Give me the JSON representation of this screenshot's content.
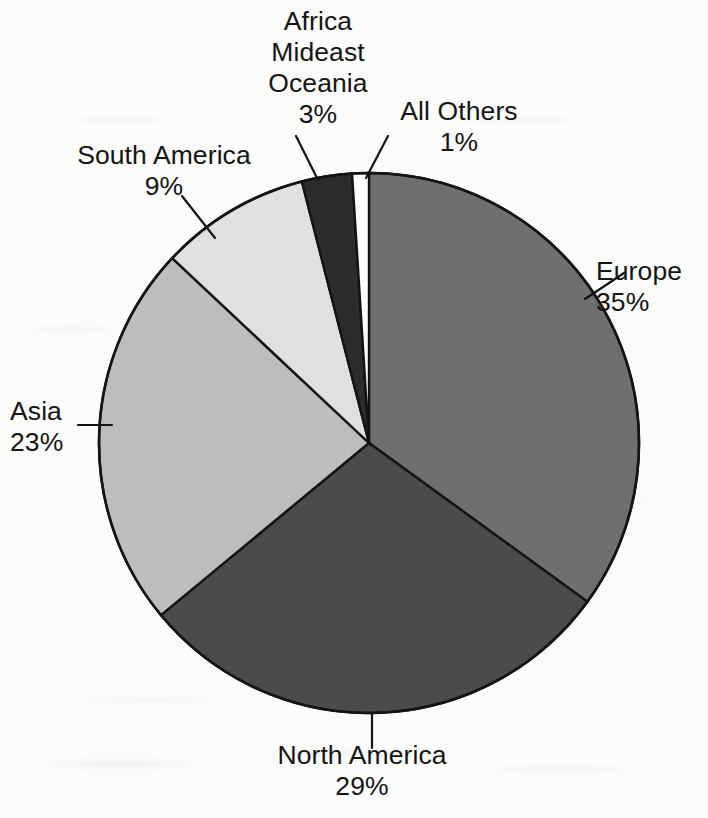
{
  "chart_data": {
    "type": "pie",
    "title": "",
    "subtitle": "",
    "xlabel": "",
    "ylabel": "",
    "legend_position": "none",
    "grid": false,
    "value_unit": "%",
    "start_angle_deg": 0,
    "direction": "clockwise",
    "categories": [
      "Europe",
      "North America",
      "Asia",
      "South America",
      "Africa Mideast Oceania",
      "All Others"
    ],
    "values": [
      35,
      29,
      23,
      9,
      3,
      1
    ],
    "total": 100,
    "slices": [
      {
        "name": "Europe",
        "label_lines": [
          "Europe"
        ],
        "value": 35,
        "value_label": "35%",
        "color": "#6f6f6f",
        "start_deg": 0,
        "end_deg": 126,
        "leader": true
      },
      {
        "name": "North America",
        "label_lines": [
          "North America"
        ],
        "value": 29,
        "value_label": "29%",
        "color": "#4b4b4b",
        "start_deg": 126,
        "end_deg": 230.4,
        "leader": true
      },
      {
        "name": "Asia",
        "label_lines": [
          "Asia"
        ],
        "value": 23,
        "value_label": "23%",
        "color": "#bdbdbd",
        "start_deg": 230.4,
        "end_deg": 313.2,
        "leader": true
      },
      {
        "name": "South America",
        "label_lines": [
          "South America"
        ],
        "value": 9,
        "value_label": "9%",
        "color": "#e0e0e0",
        "start_deg": 313.2,
        "end_deg": 345.6,
        "leader": true
      },
      {
        "name": "Africa Mideast Oceania",
        "label_lines": [
          "Africa",
          "Mideast",
          "Oceania"
        ],
        "value": 3,
        "value_label": "3%",
        "color": "#2c2c2c",
        "start_deg": 345.6,
        "end_deg": 356.4,
        "leader": true
      },
      {
        "name": "All Others",
        "label_lines": [
          "All Others"
        ],
        "value": 1,
        "value_label": "1%",
        "color": "#fdfdfb",
        "start_deg": 356.4,
        "end_deg": 360,
        "leader": true
      }
    ]
  },
  "labels": {
    "europe": {
      "line1": "Europe",
      "value": "35%"
    },
    "north_america": {
      "line1": "North America",
      "value": "29%"
    },
    "asia": {
      "line1": "Asia",
      "value": "23%"
    },
    "south_america": {
      "line1": "South America",
      "value": "9%"
    },
    "africa": {
      "line1": "Africa",
      "line2": "Mideast",
      "line3": "Oceania",
      "value": "3%"
    },
    "all_others": {
      "line1": "All Others",
      "value": "1%"
    }
  },
  "style": {
    "background": "#fbfbf9",
    "outline": "#141414",
    "text": "#151515"
  }
}
